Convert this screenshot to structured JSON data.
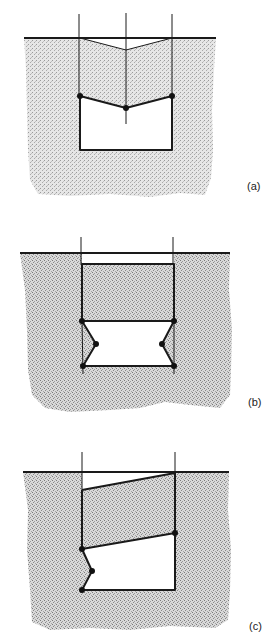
{
  "figure": {
    "colors": {
      "ink": "#1a1a1a",
      "stipple_dark": "#8a8a8a",
      "stipple_light": "#d6d6d6",
      "background": "#ffffff"
    },
    "panels": [
      {
        "id": "a",
        "label": "(a)",
        "description": "Symmetric V-shaped roof collapse: three hinges (two at walls, one at crown), rectangular opening below",
        "hinge_count": 3
      },
      {
        "id": "b",
        "label": "(b)",
        "description": "Block sliding down between two walls; walls buckle inward at mid-height with six hinges",
        "hinge_count": 6
      },
      {
        "id": "c",
        "label": "(c)",
        "description": "Tilted block with asymmetric wall buckling on left side; four hinges",
        "hinge_count": 4
      }
    ]
  }
}
